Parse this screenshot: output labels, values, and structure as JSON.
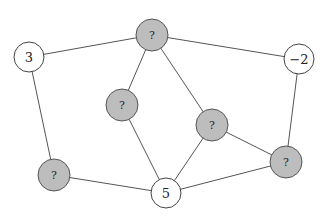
{
  "diagram": {
    "type": "graph",
    "nodes": [
      {
        "id": "a",
        "label": "3",
        "filled": false,
        "x": 29,
        "y": 57
      },
      {
        "id": "b",
        "label": "?",
        "filled": true,
        "x": 152,
        "y": 35
      },
      {
        "id": "c",
        "label": "−2",
        "filled": false,
        "x": 299,
        "y": 59
      },
      {
        "id": "d",
        "label": "?",
        "filled": true,
        "x": 122,
        "y": 105
      },
      {
        "id": "e",
        "label": "?",
        "filled": true,
        "x": 212,
        "y": 125
      },
      {
        "id": "f",
        "label": "?",
        "filled": true,
        "x": 54,
        "y": 175
      },
      {
        "id": "g",
        "label": "5",
        "filled": false,
        "x": 166,
        "y": 193
      },
      {
        "id": "h",
        "label": "?",
        "filled": true,
        "x": 286,
        "y": 162
      }
    ],
    "edges": [
      [
        "a",
        "b"
      ],
      [
        "b",
        "c"
      ],
      [
        "b",
        "d"
      ],
      [
        "b",
        "e"
      ],
      [
        "a",
        "f"
      ],
      [
        "c",
        "h"
      ],
      [
        "d",
        "g"
      ],
      [
        "e",
        "g"
      ],
      [
        "e",
        "h"
      ],
      [
        "f",
        "g"
      ],
      [
        "g",
        "h"
      ]
    ],
    "colors": {
      "filled": "#bdbdbd",
      "empty": "#ffffff",
      "stroke": "#555555"
    }
  }
}
